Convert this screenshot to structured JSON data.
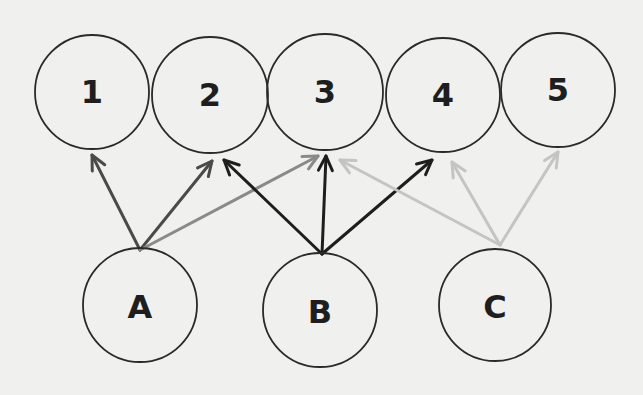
{
  "diagram": {
    "background": "#f0f0ee",
    "top_nodes": [
      {
        "id": "1",
        "label": "1",
        "cx": 92,
        "cy": 92,
        "r": 57
      },
      {
        "id": "2",
        "label": "2",
        "cx": 210,
        "cy": 95,
        "r": 58
      },
      {
        "id": "3",
        "label": "3",
        "cx": 325,
        "cy": 92,
        "r": 58
      },
      {
        "id": "4",
        "label": "4",
        "cx": 443,
        "cy": 95,
        "r": 57
      },
      {
        "id": "5",
        "label": "5",
        "cx": 558,
        "cy": 90,
        "r": 57
      }
    ],
    "bottom_nodes": [
      {
        "id": "A",
        "label": "A",
        "cx": 140,
        "cy": 305,
        "r": 57
      },
      {
        "id": "B",
        "label": "B",
        "cx": 320,
        "cy": 310,
        "r": 57
      },
      {
        "id": "C",
        "label": "C",
        "cx": 495,
        "cy": 305,
        "r": 56
      }
    ],
    "edges": [
      {
        "from": "A",
        "to": "1",
        "x1": 140,
        "y1": 250,
        "x2": 92,
        "y2": 155,
        "color": "#4a4a4a"
      },
      {
        "from": "A",
        "to": "2",
        "x1": 140,
        "y1": 250,
        "x2": 212,
        "y2": 161,
        "color": "#4a4a4a"
      },
      {
        "from": "A",
        "to": "3",
        "x1": 140,
        "y1": 250,
        "x2": 318,
        "y2": 156,
        "color": "#8a8a8a"
      },
      {
        "from": "B",
        "to": "2",
        "x1": 322,
        "y1": 254,
        "x2": 224,
        "y2": 160,
        "color": "#1e1e1e"
      },
      {
        "from": "B",
        "to": "3",
        "x1": 322,
        "y1": 254,
        "x2": 326,
        "y2": 156,
        "color": "#1e1e1e"
      },
      {
        "from": "B",
        "to": "4",
        "x1": 322,
        "y1": 254,
        "x2": 432,
        "y2": 160,
        "color": "#1e1e1e"
      },
      {
        "from": "C",
        "to": "3",
        "x1": 500,
        "y1": 245,
        "x2": 340,
        "y2": 160,
        "color": "#c4c4c4"
      },
      {
        "from": "C",
        "to": "4",
        "x1": 500,
        "y1": 245,
        "x2": 452,
        "y2": 162,
        "color": "#c4c4c4"
      },
      {
        "from": "C",
        "to": "5",
        "x1": 500,
        "y1": 245,
        "x2": 558,
        "y2": 152,
        "color": "#c4c4c4"
      }
    ]
  }
}
